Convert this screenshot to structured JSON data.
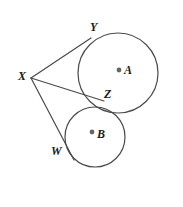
{
  "figure": {
    "kind": "geometry-diagram",
    "background_color": "#ffffff",
    "stroke_color": "#4a4a4a",
    "label_color": "#1a1a1a",
    "center_dot_color": "#666666",
    "labels": {
      "Y": "Y",
      "X": "X",
      "A": "A",
      "Z": "Z",
      "B": "B",
      "W": "W"
    },
    "points": {
      "X": {
        "x": 31,
        "y": 78
      },
      "Y": {
        "x": 88,
        "y": 40
      },
      "Z": {
        "x": 101,
        "y": 101
      },
      "W": {
        "x": 70,
        "y": 157
      },
      "A": {
        "x": 118,
        "y": 73
      },
      "B": {
        "x": 95,
        "y": 137
      }
    },
    "circles": [
      {
        "name": "circle-A",
        "cx": 118,
        "cy": 73,
        "r": 40
      },
      {
        "name": "circle-B",
        "cx": 95,
        "cy": 137,
        "r": 30
      }
    ],
    "segments": [
      {
        "name": "segment-XY",
        "from": "X",
        "to": "Y"
      },
      {
        "name": "segment-XZ",
        "from": "X",
        "to": "Z"
      },
      {
        "name": "segment-XW",
        "from": "X",
        "to": "W"
      }
    ]
  }
}
